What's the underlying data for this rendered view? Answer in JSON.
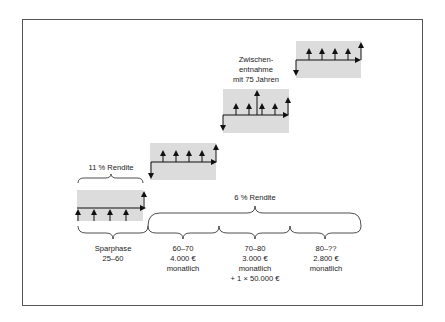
{
  "diagram": {
    "colors": {
      "box_fill": "#dcdcdc",
      "frame": "#555555",
      "ink": "#111111"
    },
    "top_labels": {
      "sparphase_return": "11 % Rendite",
      "withdrawal_return": "6 % Rendite",
      "interim_withdrawal": [
        "Zwischen-",
        "entnahme",
        "mit 75 Jahren"
      ]
    },
    "phases": [
      {
        "id": "sparphase",
        "lines": [
          "Sparphase",
          "25–60"
        ]
      },
      {
        "id": "phase-60-70",
        "lines": [
          "60–70",
          "4.000 €",
          "monatlich"
        ]
      },
      {
        "id": "phase-70-80",
        "lines": [
          "70–80",
          "3.000 €",
          "monatlich",
          "+ 1 ×  50.000 €"
        ]
      },
      {
        "id": "phase-80",
        "lines": [
          "80–??",
          "2.800 €",
          "monatlich"
        ]
      }
    ]
  }
}
